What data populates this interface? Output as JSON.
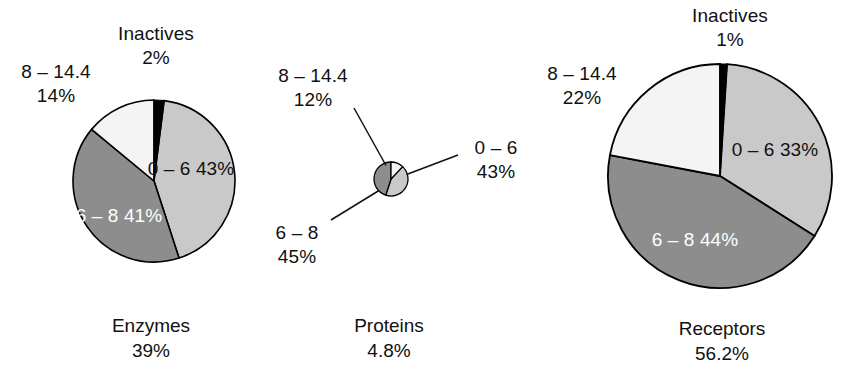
{
  "figure": {
    "background_color": "#ffffff",
    "outline_color": "#000000",
    "text_color": "#111111",
    "light_text_color": "#ffffff"
  },
  "palette": {
    "inactives": "#000000",
    "range_0_6": "#c9c9c9",
    "range_6_8": "#8d8d8d",
    "range_8_144": "#f4f4f4"
  },
  "chart_data": [
    {
      "type": "pie",
      "title": "Enzymes",
      "subtitle": "39%",
      "categories": [
        "Inactives",
        "0 – 6",
        "6 – 8",
        "8 – 14.4"
      ],
      "values": [
        2,
        43,
        41,
        14
      ],
      "value_labels": [
        "2%",
        "43%",
        "41%",
        "14%"
      ],
      "colors": [
        "#000000",
        "#c9c9c9",
        "#8d8d8d",
        "#f4f4f4"
      ],
      "label_placement": [
        "outside-top",
        "inside",
        "inside",
        "outside-left"
      ],
      "start_angle_deg": 0,
      "direction": "clockwise",
      "legend": "none"
    },
    {
      "type": "pie",
      "title": "Proteins",
      "subtitle": "4.8%",
      "categories": [
        "8 – 14.4",
        "0 – 6",
        "6 – 8"
      ],
      "values": [
        12,
        43,
        45
      ],
      "value_labels": [
        "12%",
        "43%",
        "45%"
      ],
      "colors": [
        "#f4f4f4",
        "#c9c9c9",
        "#8d8d8d"
      ],
      "label_placement": [
        "leader-upper-left",
        "leader-right",
        "leader-lower-left"
      ],
      "start_angle_deg": 0,
      "direction": "clockwise",
      "legend": "none"
    },
    {
      "type": "pie",
      "title": "Receptors",
      "subtitle": "56.2%",
      "categories": [
        "Inactives",
        "0 – 6",
        "6 – 8",
        "8 – 14.4"
      ],
      "values": [
        1,
        33,
        44,
        22
      ],
      "value_labels": [
        "1%",
        "33%",
        "44%",
        "22%"
      ],
      "colors": [
        "#000000",
        "#c9c9c9",
        "#8d8d8d",
        "#f4f4f4"
      ],
      "label_placement": [
        "outside-top",
        "inside",
        "inside",
        "outside-left"
      ],
      "start_angle_deg": 0,
      "direction": "clockwise",
      "legend": "none"
    }
  ],
  "enzymes": {
    "caption_title": "Enzymes",
    "caption_value": "39%",
    "inactives_name": "Inactives",
    "inactives_value": "2%",
    "upper_left_name": "8 – 14.4",
    "upper_left_value": "14%",
    "slice_0_6_name": "0 – 6",
    "slice_0_6_value": "43%",
    "slice_6_8_name": "6 – 8",
    "slice_6_8_value": "41%"
  },
  "proteins": {
    "caption_title": "Proteins",
    "caption_value": "4.8%",
    "upper_left_name": "8 – 14.4",
    "upper_left_value": "12%",
    "right_name": "0 – 6",
    "right_value": "43%",
    "lower_left_name": "6 – 8",
    "lower_left_value": "45%"
  },
  "receptors": {
    "caption_title": "Receptors",
    "caption_value": "56.2%",
    "inactives_name": "Inactives",
    "inactives_value": "1%",
    "upper_left_name": "8 – 14.4",
    "upper_left_value": "22%",
    "slice_0_6_name": "0 – 6",
    "slice_0_6_value": "33%",
    "slice_6_8_name": "6 – 8",
    "slice_6_8_value": "44%"
  }
}
